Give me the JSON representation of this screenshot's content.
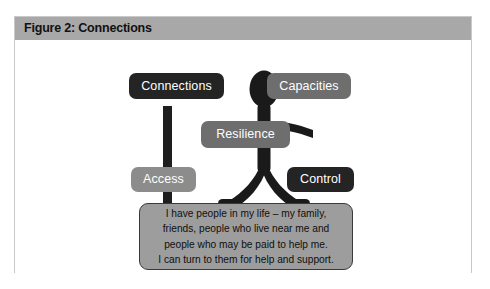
{
  "figure": {
    "caption": "Figure 2: Connections",
    "caption_bar_color": "#a8a8a8",
    "frame_border_color": "#c9c9c9",
    "background_color": "#ffffff"
  },
  "diagram": {
    "type": "stick-figure-concept-diagram",
    "central_icon": "person-stick-figure-icon",
    "labels": [
      {
        "id": "connections",
        "text": "Connections",
        "color": "#242424",
        "text_color": "#ffffff",
        "position": "top-left"
      },
      {
        "id": "capacities",
        "text": "Capacities",
        "color": "#6e6e6e",
        "text_color": "#ffffff",
        "position": "top-right"
      },
      {
        "id": "resilience",
        "text": "Resilience",
        "color": "#6e6e6e",
        "text_color": "#ffffff",
        "position": "center"
      },
      {
        "id": "access",
        "text": "Access",
        "color": "#8c8c8c",
        "text_color": "#ffffff",
        "position": "mid-left"
      },
      {
        "id": "control",
        "text": "Control",
        "color": "#242424",
        "text_color": "#ffffff",
        "position": "mid-right"
      }
    ],
    "connector": {
      "id": "connections-pole",
      "description": "vertical bar linking Connections to Access and the quote box",
      "color": "#1e1e1e"
    },
    "figure_color": "#1a1a1a"
  },
  "quote": {
    "background_color": "#9d9d9d",
    "border_color": "#3a3a3a",
    "lines": [
      "I have people in my life – my family,",
      "friends, people who live near me and",
      "people who may be paid to help me.",
      "I can turn to them for help and support."
    ]
  }
}
